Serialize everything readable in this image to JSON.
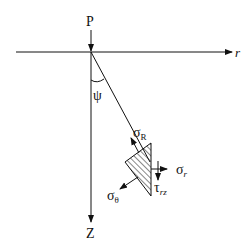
{
  "diagram": {
    "labels": {
      "load": "P",
      "r_axis": "r",
      "z_axis": "Z",
      "angle": "ψ",
      "sigma_R": "σ",
      "sigma_R_sub": "R",
      "sigma_r": "σ",
      "sigma_r_sub": "r",
      "sigma_theta": "σ",
      "sigma_theta_sub": "θ",
      "tau_rz": "τ",
      "tau_rz_sub": "rz"
    },
    "colors": {
      "stroke": "#111111",
      "background": "#ffffff"
    }
  }
}
